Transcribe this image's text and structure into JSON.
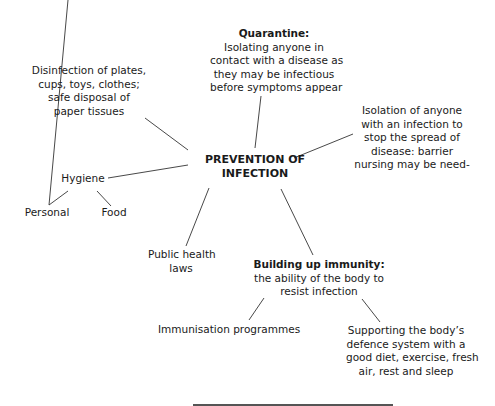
{
  "diagram": {
    "center": {
      "lines": [
        "PREVENTION OF",
        "INFECTION"
      ]
    },
    "quarantine": {
      "title": "Quarantine:",
      "lines": [
        "Isolating anyone in",
        "contact with a disease as",
        "they may be infectious",
        "before symptoms appear"
      ]
    },
    "isolation": {
      "lines": [
        "Isolation of anyone",
        "with an infection to",
        "stop the spread of",
        "disease: barrier",
        "nursing may be need-"
      ]
    },
    "disinfection": {
      "lines": [
        "Disinfection of plates,",
        "cups, toys, clothes;",
        "safe disposal of",
        "paper tissues"
      ]
    },
    "hygiene": {
      "label": "Hygiene",
      "children": [
        {
          "label": "Personal"
        },
        {
          "label": "Food"
        }
      ]
    },
    "public_health": {
      "lines": [
        "Public health",
        "laws"
      ]
    },
    "immunity": {
      "title": "Building up immunity:",
      "lines": [
        "the ability of the body to",
        "resist infection"
      ],
      "children": [
        {
          "lines": [
            "Immunisation programmes"
          ]
        },
        {
          "lines": [
            "Supporting the body’s",
            "defence system with a",
            "good diet, exercise, fresh",
            "air, rest and sleep"
          ]
        }
      ]
    }
  },
  "colors": {
    "text": "#1a1a1a",
    "line": "#333333",
    "background": "#ffffff"
  }
}
